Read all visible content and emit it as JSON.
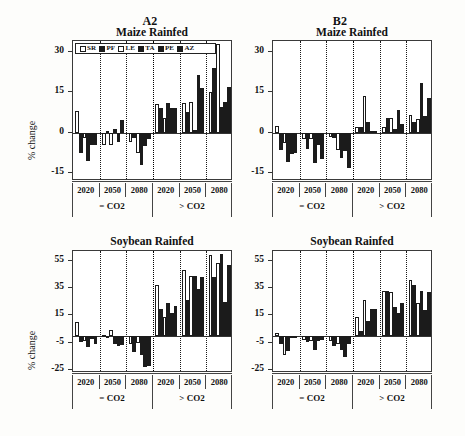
{
  "figure": {
    "y_axis_title": "% change",
    "scenarios": [
      {
        "key": "A2",
        "label": "A2"
      },
      {
        "key": "B2",
        "label": "B2"
      }
    ],
    "legend": {
      "entries": [
        {
          "label": "SR",
          "fill": "open"
        },
        {
          "label": "PF",
          "fill": "fill"
        },
        {
          "label": "LE",
          "fill": "open"
        },
        {
          "label": "TA",
          "fill": "fill"
        },
        {
          "label": "PE",
          "fill": "fill"
        },
        {
          "label": "AZ",
          "fill": "fill"
        }
      ]
    },
    "co2_groups": [
      {
        "label": "= CO2"
      },
      {
        "label": "> CO2"
      }
    ],
    "years": [
      "2020",
      "2050",
      "2080"
    ]
  },
  "chart_data": [
    {
      "id": "a2-maize",
      "type": "bar",
      "title": "Maize Rainfed",
      "scenario": "A2",
      "xlabel": "",
      "ylabel": "% change",
      "ylim": [
        -18,
        34
      ],
      "yticks": [
        -15,
        0,
        15,
        30
      ],
      "ytick_labels": [
        "-15",
        "0",
        "15",
        "30"
      ],
      "grid": false,
      "legend_position": "top-left-inside",
      "categories": [
        "2020 = CO2",
        "2050 = CO2",
        "2080 = CO2",
        "2020 > CO2",
        "2050 > CO2",
        "2080 > CO2"
      ],
      "series": [
        {
          "name": "SR",
          "fill": "open",
          "values": [
            8.0,
            -4.5,
            -3.5,
            10.5,
            11.0,
            15.0
          ]
        },
        {
          "name": "PF",
          "fill": "fill",
          "values": [
            -7.5,
            0.5,
            -2.0,
            9.0,
            7.5,
            24.0
          ]
        },
        {
          "name": "LE",
          "fill": "open",
          "values": [
            -2.0,
            -4.5,
            -7.5,
            5.5,
            11.5,
            33.0
          ]
        },
        {
          "name": "TA",
          "fill": "fill",
          "values": [
            -10.5,
            1.5,
            -12.0,
            11.0,
            1.0,
            9.5
          ]
        },
        {
          "name": "PE",
          "fill": "fill",
          "values": [
            -4.5,
            -3.5,
            -5.0,
            9.0,
            21.5,
            11.5
          ]
        },
        {
          "name": "AZ",
          "fill": "fill",
          "values": [
            -4.5,
            4.5,
            -2.5,
            9.0,
            16.5,
            17.0
          ]
        }
      ]
    },
    {
      "id": "b2-maize",
      "type": "bar",
      "title": "Maize Rainfed",
      "scenario": "B2",
      "xlabel": "",
      "ylabel": "% change",
      "ylim": [
        -18,
        34
      ],
      "yticks": [
        -15,
        0,
        15,
        30
      ],
      "ytick_labels": [
        "-15",
        "0",
        "15",
        "30"
      ],
      "grid": false,
      "legend_position": "none",
      "categories": [
        "2020 = CO2",
        "2050 = CO2",
        "2080 = CO2",
        "2020 > CO2",
        "2050 > CO2",
        "2080 > CO2"
      ],
      "series": [
        {
          "name": "SR",
          "fill": "open",
          "values": [
            2.5,
            -2.5,
            -1.5,
            2.0,
            2.0,
            6.5
          ]
        },
        {
          "name": "PF",
          "fill": "fill",
          "values": [
            -6.5,
            -6.0,
            -2.0,
            2.0,
            5.5,
            4.0
          ]
        },
        {
          "name": "LE",
          "fill": "open",
          "values": [
            -4.0,
            -2.5,
            -6.5,
            13.5,
            5.5,
            5.0
          ]
        },
        {
          "name": "TA",
          "fill": "fill",
          "values": [
            -11.0,
            -11.5,
            -9.5,
            4.0,
            1.5,
            18.5
          ]
        },
        {
          "name": "PE",
          "fill": "fill",
          "values": [
            -8.0,
            -4.5,
            -7.0,
            0.5,
            8.5,
            6.0
          ]
        },
        {
          "name": "AZ",
          "fill": "fill",
          "values": [
            -7.5,
            -10.0,
            -13.0,
            0.5,
            3.0,
            13.0
          ]
        }
      ]
    },
    {
      "id": "a2-soybean",
      "type": "bar",
      "title": "Soybean Rainfed",
      "scenario": "A2",
      "xlabel": "",
      "ylabel": "% change",
      "ylim": [
        -27,
        62
      ],
      "yticks": [
        -25,
        -5,
        15,
        35,
        55
      ],
      "ytick_labels": [
        "-25",
        "-5",
        "15",
        "35",
        "55"
      ],
      "grid": false,
      "legend_position": "none",
      "categories": [
        "2020 = CO2",
        "2050 = CO2",
        "2080 = CO2",
        "2020 > CO2",
        "2050 > CO2",
        "2080 > CO2"
      ],
      "series": [
        {
          "name": "SR",
          "fill": "open",
          "values": [
            10.0,
            0.5,
            -5.5,
            37.0,
            48.0,
            59.0
          ]
        },
        {
          "name": "PF",
          "fill": "fill",
          "values": [
            -4.5,
            0.0,
            -12.0,
            20.0,
            26.0,
            43.0
          ]
        },
        {
          "name": "LE",
          "fill": "open",
          "values": [
            -3.5,
            4.5,
            -5.0,
            13.5,
            44.0,
            53.0
          ]
        },
        {
          "name": "TA",
          "fill": "fill",
          "values": [
            -8.0,
            -6.0,
            -14.0,
            24.0,
            44.0,
            60.0
          ]
        },
        {
          "name": "PE",
          "fill": "fill",
          "values": [
            -2.5,
            -7.5,
            -22.5,
            17.0,
            34.0,
            25.0
          ]
        },
        {
          "name": "AZ",
          "fill": "fill",
          "values": [
            -6.0,
            -6.5,
            -22.0,
            22.0,
            43.0,
            52.0
          ]
        }
      ]
    },
    {
      "id": "b2-soybean",
      "type": "bar",
      "title": "Soybean Rainfed",
      "scenario": "B2",
      "xlabel": "",
      "ylabel": "% change",
      "ylim": [
        -27,
        62
      ],
      "yticks": [
        -25,
        -5,
        15,
        35,
        55
      ],
      "ytick_labels": [
        "-25",
        "-5",
        "15",
        "35",
        "55"
      ],
      "grid": false,
      "legend_position": "none",
      "categories": [
        "2020 = CO2",
        "2050 = CO2",
        "2080 = CO2",
        "2020 > CO2",
        "2050 > CO2",
        "2080 > CO2"
      ],
      "series": [
        {
          "name": "SR",
          "fill": "open",
          "values": [
            2.0,
            -3.0,
            -3.5,
            13.5,
            33.0,
            41.0
          ]
        },
        {
          "name": "PF",
          "fill": "fill",
          "values": [
            -6.0,
            -4.5,
            -7.0,
            4.0,
            33.0,
            37.0
          ]
        },
        {
          "name": "LE",
          "fill": "open",
          "values": [
            -14.0,
            -4.0,
            -5.5,
            26.0,
            32.0,
            24.0
          ]
        },
        {
          "name": "TA",
          "fill": "fill",
          "values": [
            -11.0,
            -10.5,
            -10.0,
            11.0,
            21.0,
            33.0
          ]
        },
        {
          "name": "PE",
          "fill": "fill",
          "values": [
            -1.0,
            -3.5,
            -15.0,
            20.0,
            17.0,
            19.0
          ]
        },
        {
          "name": "AZ",
          "fill": "fill",
          "values": [
            -1.0,
            -3.0,
            -5.5,
            20.0,
            24.0,
            32.0
          ]
        }
      ]
    }
  ]
}
